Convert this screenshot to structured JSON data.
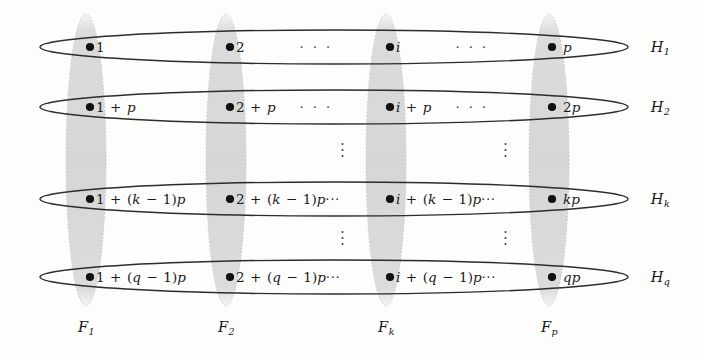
{
  "figure": {
    "colors": {
      "background": "#fdfdfc",
      "ellipse_stroke": "#2c2c2c",
      "column_fill": "#d9d9d9",
      "column_stroke": "#bdbdbd",
      "node_fill": "#111111",
      "text": "#181818"
    },
    "geometry": {
      "row_ellipse_left": 40,
      "row_ellipse_right": 628,
      "row_ellipse_height": 34,
      "column_top": 14,
      "column_bottom": 306,
      "column_width": 40
    }
  },
  "rows": [
    {
      "id": "H1",
      "label": "H",
      "label_sub": "1",
      "center_y": 47,
      "cells": [
        {
          "col": 1,
          "x": 90,
          "text": "1",
          "trail": ""
        },
        {
          "col": 2,
          "x": 230,
          "text": "2",
          "trail": ""
        },
        {
          "col": "k",
          "x": 390,
          "text": "i",
          "trail": ""
        },
        {
          "col": "p",
          "x": 552,
          "text": "p",
          "trail": "",
          "gap": true
        }
      ]
    },
    {
      "id": "H2",
      "label": "H",
      "label_sub": "2",
      "center_y": 107,
      "cells": [
        {
          "col": 1,
          "x": 90,
          "text": "1 + p",
          "trail": ""
        },
        {
          "col": 2,
          "x": 230,
          "text": "2 + p",
          "trail": ""
        },
        {
          "col": "k",
          "x": 390,
          "text": "i + p",
          "trail": ""
        },
        {
          "col": "p",
          "x": 552,
          "text": "2p",
          "trail": "",
          "gap": true
        }
      ]
    },
    {
      "id": "Hk",
      "label": "H",
      "label_sub": "k",
      "center_y": 199,
      "cells": [
        {
          "col": 1,
          "x": 90,
          "text": "1 + (k − 1)p",
          "trail": ""
        },
        {
          "col": 2,
          "x": 230,
          "text": "2 + (k − 1)p",
          "trail": "···"
        },
        {
          "col": "k",
          "x": 390,
          "text": "i + (k − 1)p",
          "trail": "···"
        },
        {
          "col": "p",
          "x": 552,
          "text": "kp",
          "trail": "",
          "gap": true
        }
      ]
    },
    {
      "id": "Hq",
      "label": "H",
      "label_sub": "q",
      "center_y": 277,
      "cells": [
        {
          "col": 1,
          "x": 90,
          "text": "1 + (q − 1)p",
          "trail": ""
        },
        {
          "col": 2,
          "x": 230,
          "text": "2 + (q − 1)p",
          "trail": "···"
        },
        {
          "col": "k",
          "x": 390,
          "text": "i + (q − 1)p",
          "trail": "···"
        },
        {
          "col": "p",
          "x": 552,
          "text": "qp",
          "trail": "",
          "gap": true
        }
      ]
    }
  ],
  "row_labels": [
    {
      "id": "H1-label",
      "label": "H",
      "sub": "1",
      "x": 660,
      "y": 47
    },
    {
      "id": "H2-label",
      "label": "H",
      "sub": "2",
      "x": 660,
      "y": 107
    },
    {
      "id": "Hk-label",
      "label": "H",
      "sub": "k",
      "x": 660,
      "y": 199
    },
    {
      "id": "Hq-label",
      "label": "H",
      "sub": "q",
      "x": 660,
      "y": 277
    }
  ],
  "columns": [
    {
      "id": "F1",
      "label": "F",
      "sub": "1",
      "center_x": 86,
      "label_x": 86,
      "label_y": 327
    },
    {
      "id": "F2",
      "label": "F",
      "sub": "2",
      "center_x": 226,
      "label_x": 226,
      "label_y": 327
    },
    {
      "id": "Fk",
      "label": "F",
      "sub": "k",
      "center_x": 386,
      "label_x": 386,
      "label_y": 327
    },
    {
      "id": "Fp",
      "label": "F",
      "sub": "p",
      "center_x": 549,
      "label_x": 549,
      "label_y": 327
    }
  ],
  "horizontal_ellipses": [
    {
      "id": "row1-dots-a",
      "x": 316,
      "y": 47,
      "text": "· · ·"
    },
    {
      "id": "row1-dots-b",
      "x": 472,
      "y": 47,
      "text": "· · ·"
    },
    {
      "id": "row2-dots-a",
      "x": 316,
      "y": 107,
      "text": "· · ·"
    },
    {
      "id": "row2-dots-b",
      "x": 472,
      "y": 107,
      "text": "· · ·"
    }
  ],
  "vertical_ellipses": [
    {
      "id": "vdots-top-left",
      "x": 342,
      "y": 150
    },
    {
      "id": "vdots-top-right",
      "x": 505,
      "y": 150
    },
    {
      "id": "vdots-bottom-left",
      "x": 342,
      "y": 238
    },
    {
      "id": "vdots-bottom-right",
      "x": 505,
      "y": 238
    }
  ]
}
